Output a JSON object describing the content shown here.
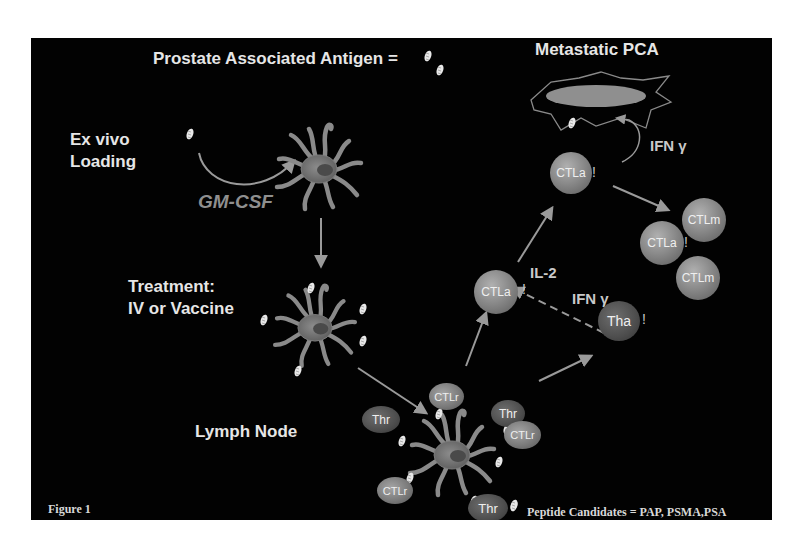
{
  "figure": {
    "caption": "Figure 1",
    "title": "Prostate Associated Antigen =",
    "legend": "Peptide Candidates = PAP, PSMA,PSA",
    "colors": {
      "background": "#020202",
      "text": "#e6e6e6",
      "arrow": "#9a9a9a",
      "cell_light": "#8a8a8a",
      "cell_dark": "#4d4d4d"
    }
  },
  "stages": {
    "ex_vivo": {
      "line1": "Ex vivo",
      "line2": "Loading"
    },
    "gm_csf": "GM-CSF",
    "treatment": {
      "line1": "Treatment:",
      "line2": "IV or Vaccine"
    },
    "lymph_node": "Lymph Node",
    "metastatic": "Metastatic PCA"
  },
  "cytokines": {
    "ifn_top": "IFN γ",
    "il2": "IL-2",
    "ifn_mid": "IFN γ"
  },
  "cells": {
    "ctla_top": {
      "label": "CTLa",
      "mark": "!"
    },
    "ctla_mid": {
      "label": "CTLa",
      "mark": "!"
    },
    "ctla_right": {
      "label": "CTLa",
      "mark": "!"
    },
    "ctlm_1": {
      "label": "CTLm"
    },
    "ctlm_2": {
      "label": "CTLm"
    },
    "tha": {
      "label": "Tha",
      "mark": "!"
    },
    "ln_ctlr_top": {
      "label": "CTLr"
    },
    "ln_ctlr_right": {
      "label": "CTLr"
    },
    "ln_ctlr_left": {
      "label": "CTLr"
    },
    "ln_thr_left": {
      "label": "Thr"
    },
    "ln_thr_right": {
      "label": "Thr"
    },
    "ln_thr_bottom": {
      "label": "Thr"
    }
  },
  "icons": {
    "antigen": "antigen-peptide-icon",
    "dendritic_cell": "dendritic-cell-icon",
    "tumor_cell": "tumor-cell-icon",
    "arrow": "arrow-icon"
  }
}
